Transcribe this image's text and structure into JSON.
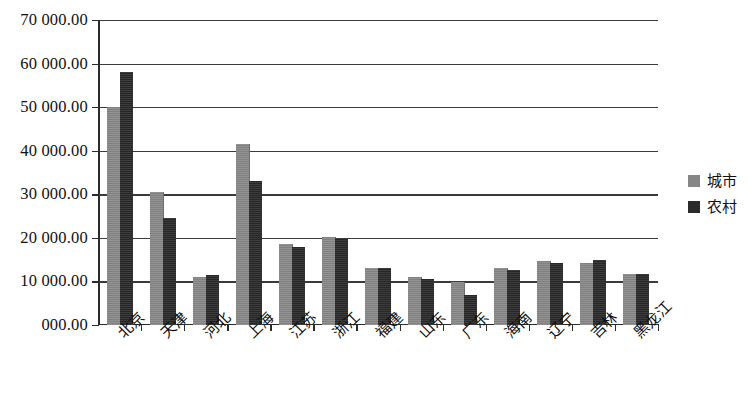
{
  "chart_data": {
    "type": "bar",
    "title": "",
    "xlabel": "",
    "ylabel": "",
    "ylim": [
      0,
      70000
    ],
    "ytick_labels": [
      "70 000.00",
      "60 000.00",
      "50 000.00",
      "40 000.00",
      "30 000.00",
      "20 000.00",
      "10 000.00",
      "000.00"
    ],
    "ytick_values": [
      70000,
      60000,
      50000,
      40000,
      30000,
      20000,
      10000,
      0
    ],
    "grid": true,
    "legend_position": "right",
    "categories": [
      "北京",
      "天津",
      "河北",
      "上海",
      "江苏",
      "浙江",
      "福建",
      "山东",
      "广东",
      "海南",
      "辽宁",
      "吉林",
      "黑龙江"
    ],
    "series": [
      {
        "name": "城市",
        "color": "#868686",
        "values": [
          50000,
          30500,
          11000,
          41500,
          18500,
          20100,
          13200,
          11000,
          9900,
          13000,
          14700,
          14300,
          11800
        ]
      },
      {
        "name": "农村",
        "color": "#2c2c2c",
        "values": [
          58000,
          24500,
          11500,
          33000,
          17800,
          20000,
          13200,
          10500,
          7000,
          12700,
          14200,
          15000,
          11800
        ]
      }
    ]
  },
  "legend": {
    "items": [
      {
        "label": "城市"
      },
      {
        "label": "农村"
      }
    ]
  }
}
